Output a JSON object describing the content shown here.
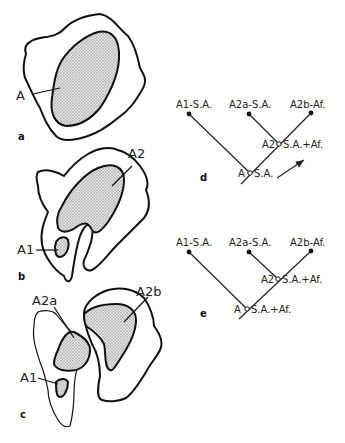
{
  "panels": {
    "a": {
      "letter": "a",
      "labels": [
        "A"
      ]
    },
    "b": {
      "letter": "b",
      "labels": [
        "A2",
        "A1"
      ]
    },
    "c": {
      "letter": "c",
      "labels": [
        "A2a",
        "A2b",
        "A1"
      ]
    },
    "d": {
      "letter": "d",
      "tips": [
        "A1-S.A.",
        "A2a-S.A.",
        "A2b-Af."
      ],
      "node_a2": "A2",
      "node_a2_state": "S.A.+Af.",
      "node_a": "A",
      "node_a_state": "S.A."
    },
    "e": {
      "letter": "e",
      "tips": [
        "A1-S.A.",
        "A2a-S.A.",
        "A2b-Af."
      ],
      "node_a2": "A2",
      "node_a2_state": "S.A.+Af.",
      "node_a": "A",
      "node_a_state": "S.A.+Af."
    }
  },
  "colors": {
    "ink": "#111111",
    "stipple": "#bdbdbd",
    "background": "#ffffff"
  }
}
